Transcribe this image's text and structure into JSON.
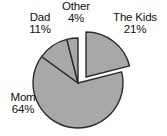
{
  "chart_data": {
    "type": "pie",
    "title": "",
    "subtitle": "",
    "xlabel": "",
    "ylabel": "",
    "grid": false,
    "legend_position": "none",
    "label_format": "name + percent, placed outside slices",
    "units": "percent",
    "total": 100,
    "categories": [
      "The Kids",
      "Mom",
      "Dad",
      "Other"
    ],
    "values": [
      21,
      64,
      11,
      4
    ],
    "slices": [
      {
        "name": "The Kids",
        "value": 21,
        "percent_text": "21%",
        "exploded": true,
        "start_angle_deg": 0,
        "end_angle_deg": 75.6,
        "fill": "#a8a8a8",
        "stroke": "#2b2b2b"
      },
      {
        "name": "Mom",
        "value": 64,
        "percent_text": "64%",
        "exploded": false,
        "start_angle_deg": 75.6,
        "end_angle_deg": 306.0,
        "fill": "#a8a8a8",
        "stroke": "#2b2b2b"
      },
      {
        "name": "Dad",
        "value": 11,
        "percent_text": "11%",
        "exploded": false,
        "start_angle_deg": 306.0,
        "end_angle_deg": 345.6,
        "fill": "#a8a8a8",
        "stroke": "#2b2b2b"
      },
      {
        "name": "Other",
        "value": 4,
        "percent_text": "4%",
        "exploded": false,
        "start_angle_deg": 345.6,
        "end_angle_deg": 360.0,
        "fill": "#a8a8a8",
        "stroke": "#2b2b2b"
      }
    ],
    "colors": {
      "slice_fill": "#a8a8a8",
      "slice_outline": "#2b2b2b",
      "background": "#ffffff",
      "label_text": "#111111"
    }
  },
  "labels": {
    "the_kids": {
      "name": "The Kids",
      "percent": "21%"
    },
    "mom": {
      "name": "Mom",
      "percent": "64%"
    },
    "dad": {
      "name": "Dad",
      "percent": "11%"
    },
    "other": {
      "name": "Other",
      "percent": "4%"
    }
  }
}
